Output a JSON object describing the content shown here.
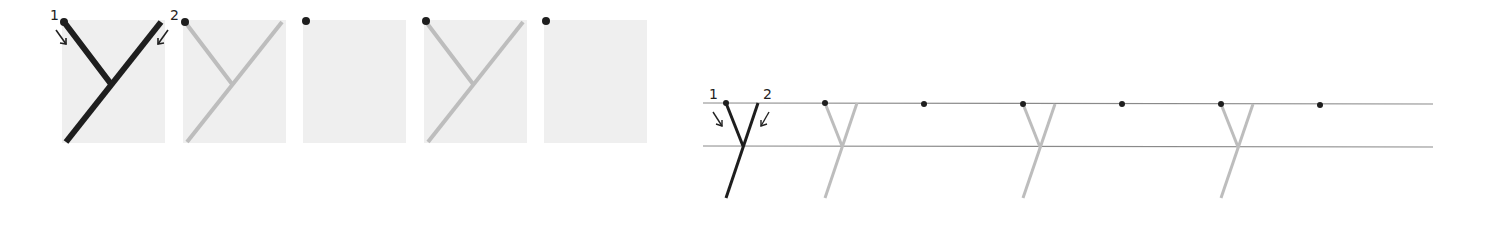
{
  "figure": {
    "letter": "y",
    "stroke_labels": [
      "1",
      "2"
    ],
    "colors": {
      "dark_stroke": "#1e1e1e",
      "light_stroke": "#bdbdbd",
      "panel_bg": "#efefef",
      "guideline": "#8a8a8a",
      "dot": "#1e1e1e"
    }
  },
  "left_panels": [
    {
      "index": 1,
      "content": "dark y with stroke order arrows",
      "x": 62
    },
    {
      "index": 2,
      "content": "light tracing y with start dot",
      "x": 183
    },
    {
      "index": 3,
      "content": "blank with start dot",
      "x": 303
    },
    {
      "index": 4,
      "content": "light tracing y with start dot",
      "x": 424
    },
    {
      "index": 5,
      "content": "blank with start dot",
      "x": 544
    }
  ],
  "right_row": {
    "items": [
      {
        "type": "model-y",
        "x": 726
      },
      {
        "type": "trace-y",
        "x": 825
      },
      {
        "type": "dot",
        "x": 924
      },
      {
        "type": "trace-y",
        "x": 1023
      },
      {
        "type": "dot",
        "x": 1122
      },
      {
        "type": "trace-y",
        "x": 1221
      },
      {
        "type": "dot",
        "x": 1320
      }
    ]
  }
}
